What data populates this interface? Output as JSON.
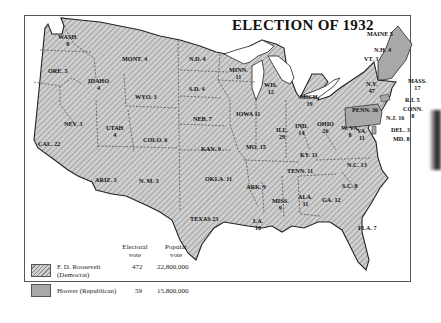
{
  "title": "ELECTION OF 1932",
  "colors": {
    "democrat_fill": "#c9c9c9",
    "democrat_hatch": "#8a8a8a",
    "republican_fill": "#a8a8a8",
    "water": "#ffffff",
    "border": "#333333"
  },
  "states": [
    {
      "id": "wash",
      "label": "WASH.",
      "votes": "8",
      "party": "D"
    },
    {
      "id": "ore",
      "label": "ORE.",
      "votes": "5",
      "party": "D"
    },
    {
      "id": "cal",
      "label": "CAL.",
      "votes": "22",
      "party": "D"
    },
    {
      "id": "idaho",
      "label": "IDAHO",
      "votes": "4",
      "party": "D"
    },
    {
      "id": "nev",
      "label": "NEV.",
      "votes": "3",
      "party": "D"
    },
    {
      "id": "mont",
      "label": "MONT.",
      "votes": "4",
      "party": "D"
    },
    {
      "id": "wyo",
      "label": "WYO.",
      "votes": "3",
      "party": "D"
    },
    {
      "id": "utah",
      "label": "UTAH",
      "votes": "4",
      "party": "D"
    },
    {
      "id": "colo",
      "label": "COLO.",
      "votes": "6",
      "party": "D"
    },
    {
      "id": "ariz",
      "label": "ARIZ.",
      "votes": "3",
      "party": "D"
    },
    {
      "id": "nm",
      "label": "N. M.",
      "votes": "3",
      "party": "D"
    },
    {
      "id": "nd",
      "label": "N.D.",
      "votes": "4",
      "party": "D"
    },
    {
      "id": "sd",
      "label": "S.D.",
      "votes": "4",
      "party": "D"
    },
    {
      "id": "neb",
      "label": "NEB.",
      "votes": "7",
      "party": "D"
    },
    {
      "id": "kan",
      "label": "KAN.",
      "votes": "9",
      "party": "D"
    },
    {
      "id": "okla",
      "label": "OKLA.",
      "votes": "11",
      "party": "D"
    },
    {
      "id": "texas",
      "label": "TEXAS",
      "votes": "23",
      "party": "D"
    },
    {
      "id": "minn",
      "label": "MINN.",
      "votes": "11",
      "party": "D"
    },
    {
      "id": "iowa",
      "label": "IOWA",
      "votes": "11",
      "party": "D"
    },
    {
      "id": "mo",
      "label": "MO.",
      "votes": "15",
      "party": "D"
    },
    {
      "id": "ark",
      "label": "ARK.",
      "votes": "9",
      "party": "D"
    },
    {
      "id": "la",
      "label": "LA.",
      "votes": "10",
      "party": "D"
    },
    {
      "id": "wis",
      "label": "WIS.",
      "votes": "12",
      "party": "D"
    },
    {
      "id": "ill",
      "label": "ILL.",
      "votes": "29",
      "party": "D"
    },
    {
      "id": "mich",
      "label": "MICH.",
      "votes": "19",
      "party": "D"
    },
    {
      "id": "ind",
      "label": "IND.",
      "votes": "14",
      "party": "D"
    },
    {
      "id": "ohio",
      "label": "OHIO",
      "votes": "26",
      "party": "D"
    },
    {
      "id": "ky",
      "label": "KY.",
      "votes": "11",
      "party": "D"
    },
    {
      "id": "tenn",
      "label": "TENN.",
      "votes": "11",
      "party": "D"
    },
    {
      "id": "miss",
      "label": "MISS.",
      "votes": "9",
      "party": "D"
    },
    {
      "id": "ala",
      "label": "ALA.",
      "votes": "11",
      "party": "D"
    },
    {
      "id": "ga",
      "label": "GA.",
      "votes": "12",
      "party": "D"
    },
    {
      "id": "fla",
      "label": "FLA.",
      "votes": "7",
      "party": "D"
    },
    {
      "id": "sc",
      "label": "S.C.",
      "votes": "8",
      "party": "D"
    },
    {
      "id": "nc",
      "label": "N.C.",
      "votes": "13",
      "party": "D"
    },
    {
      "id": "va",
      "label": "VA.",
      "votes": "11",
      "party": "D"
    },
    {
      "id": "wva",
      "label": "W. VA.",
      "votes": "8",
      "party": "D"
    },
    {
      "id": "md",
      "label": "MD.",
      "votes": "8",
      "party": "D"
    },
    {
      "id": "del",
      "label": "DEL.",
      "votes": "3",
      "party": "R"
    },
    {
      "id": "nj",
      "label": "N.J.",
      "votes": "16",
      "party": "D"
    },
    {
      "id": "penn",
      "label": "PENN.",
      "votes": "36",
      "party": "R"
    },
    {
      "id": "ny",
      "label": "N.Y.",
      "votes": "47",
      "party": "D"
    },
    {
      "id": "conn",
      "label": "CONN.",
      "votes": "8",
      "party": "R"
    },
    {
      "id": "ri",
      "label": "R.I.",
      "votes": "5",
      "party": "D"
    },
    {
      "id": "mass",
      "label": "MASS.",
      "votes": "17",
      "party": "D"
    },
    {
      "id": "vt",
      "label": "VT.",
      "votes": "3",
      "party": "R"
    },
    {
      "id": "nh",
      "label": "N.H.",
      "votes": "4",
      "party": "R"
    },
    {
      "id": "maine",
      "label": "MAINE",
      "votes": "5",
      "party": "R"
    }
  ],
  "legend": {
    "col_electoral": "Electoral vote",
    "col_electoral_l1": "Electoral",
    "col_electoral_l2": "vote",
    "col_popular_l1": "Popular",
    "col_popular_l2": "vote",
    "rows": [
      {
        "candidate_l1": "F. D. Roosevelt",
        "candidate_l2": "(Democrat)",
        "electoral": "472",
        "popular": "22,800,000",
        "pattern": "hatched"
      },
      {
        "candidate_l1": "Hoover (Republican)",
        "electoral": "59",
        "popular": "15,800,000",
        "pattern": "solid"
      }
    ]
  }
}
